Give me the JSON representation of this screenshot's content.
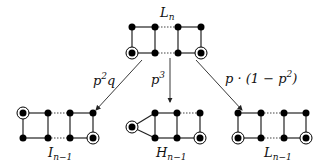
{
  "graphs": {
    "top": {
      "label": "L",
      "sub": "n"
    },
    "left": {
      "label": "I",
      "sub": "n−1"
    },
    "middle": {
      "label": "H",
      "sub": "n−1"
    },
    "right": {
      "label": "L",
      "sub": "n−1"
    }
  },
  "arrows": {
    "left": {
      "label_base": "p",
      "label_sup": "2",
      "label_tail": "q"
    },
    "middle": {
      "label_base": "p",
      "label_sup": "3"
    },
    "right": {
      "label_base": "p · (1 − p",
      "label_sup": "2",
      "label_tail": ")"
    }
  }
}
